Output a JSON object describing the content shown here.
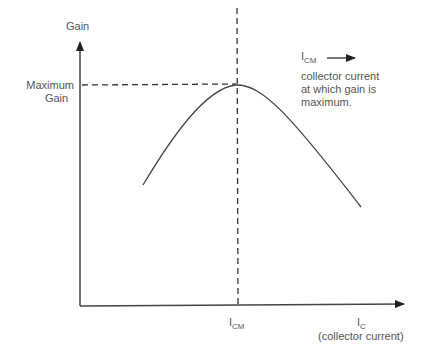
{
  "diagram": {
    "y_axis": {
      "label": "Gain"
    },
    "x_axis": {
      "label_main": "I",
      "label_sub": "C",
      "label_desc": "(collector current)"
    },
    "max_marker": {
      "line1": "Maximum",
      "line2": "Gain"
    },
    "icm_tick": {
      "main": "I",
      "sub": "CM"
    },
    "legend": {
      "symbol_main": "I",
      "symbol_sub": "CM",
      "line1": "collector current",
      "line2": "at which gain is",
      "line3": "maximum."
    },
    "colors": {
      "line": "#444444",
      "text": "#555555"
    }
  }
}
